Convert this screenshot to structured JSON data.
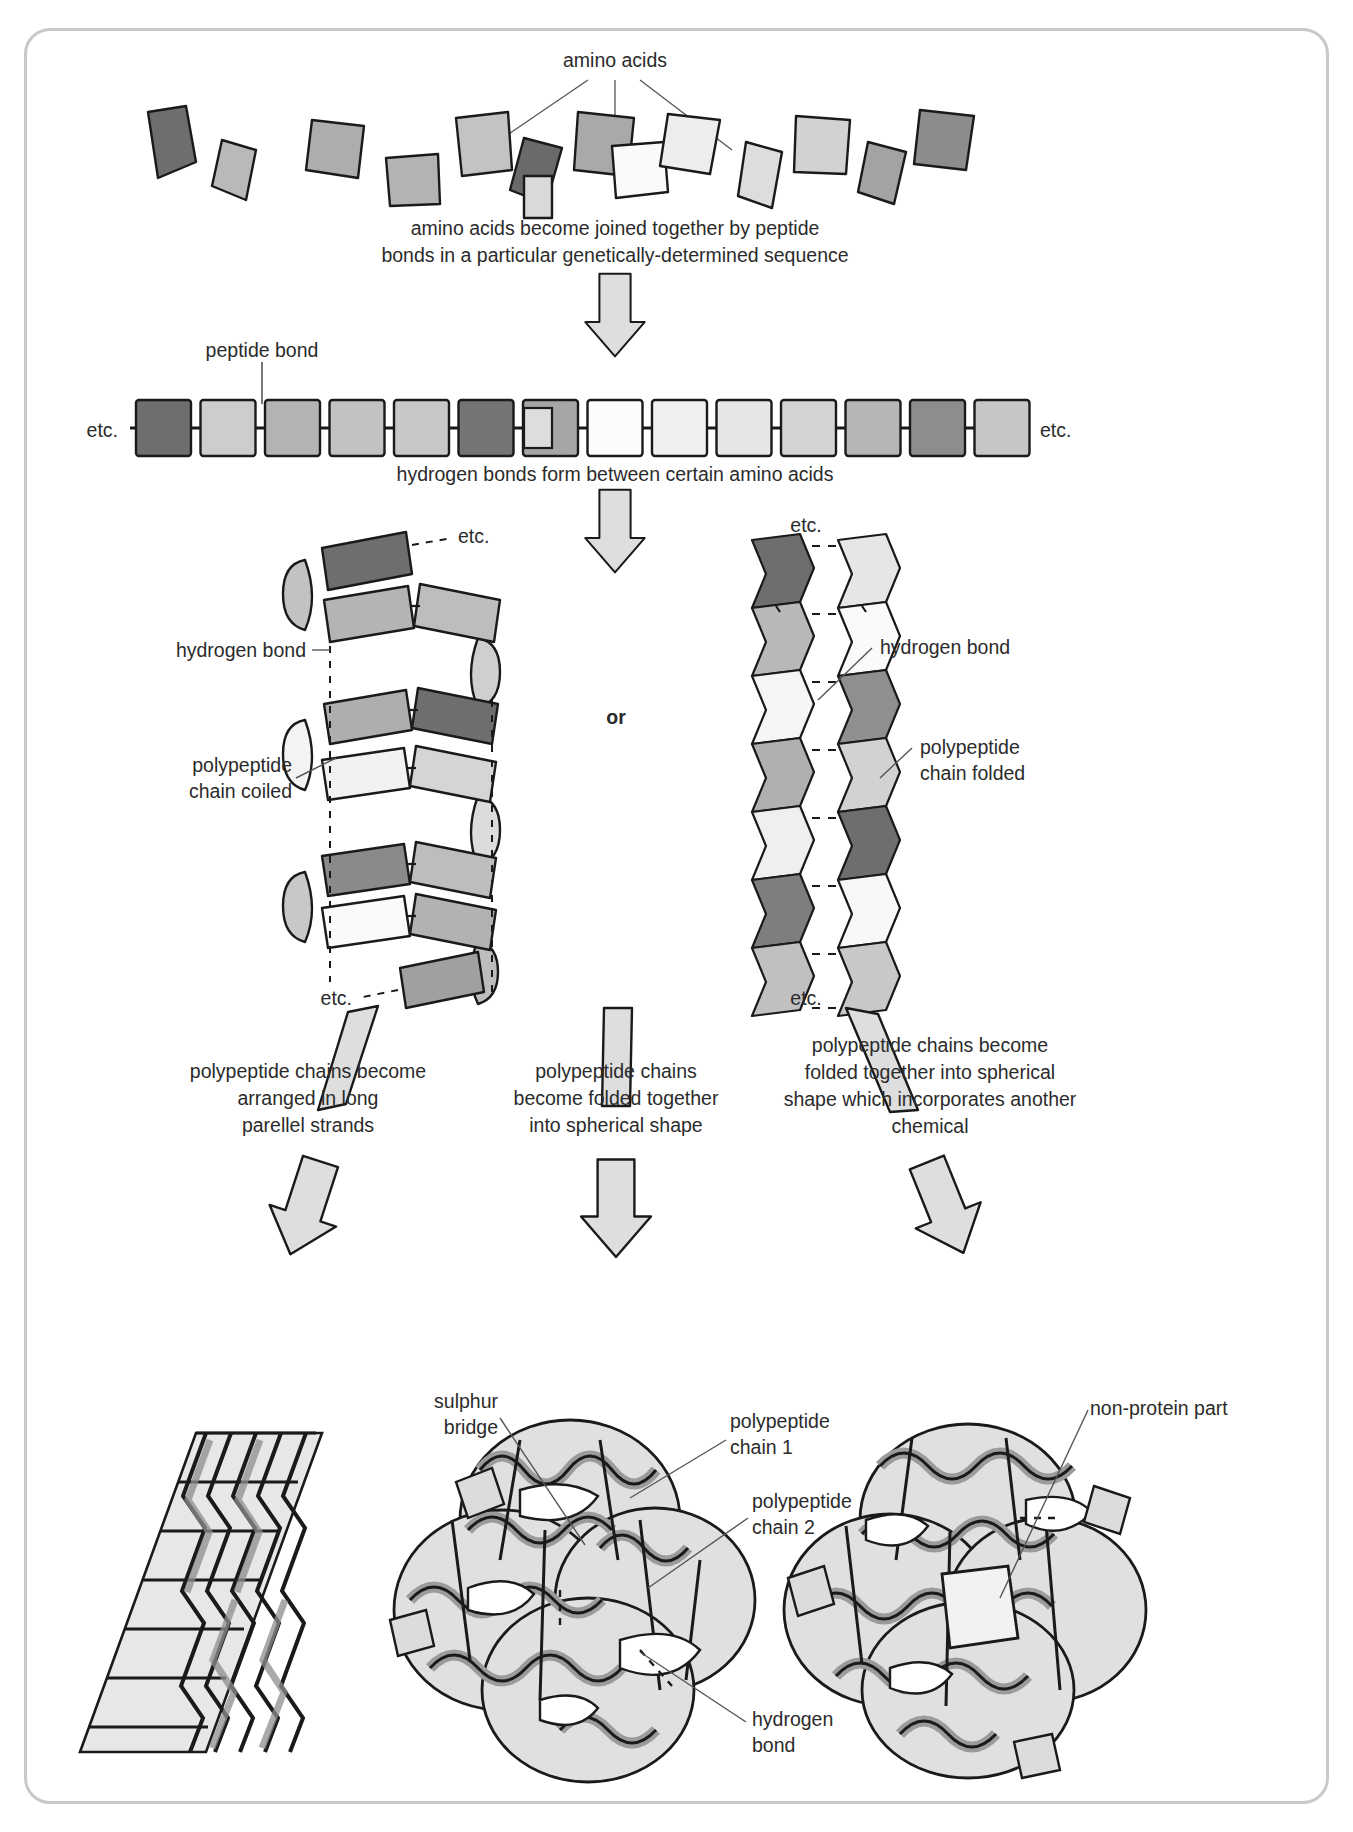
{
  "diagram": {
    "labels": {
      "amino_acids": "amino acids",
      "step1": "amino acids become joined together by peptide\nbonds in a particular genetically-determined sequence",
      "peptide_bond": "peptide bond",
      "etc_left_chain": "etc.",
      "etc_right_chain": "etc.",
      "step2": "hydrogen bonds form between certain amino acids",
      "or": "or",
      "helix_etc_top": "etc.",
      "helix_etc_bottom": "etc.",
      "helix_hydrogen_bond": "hydrogen bond",
      "helix_polypeptide": "polypeptide\nchain coiled",
      "sheet_etc_top": "etc.",
      "sheet_etc_bottom": "etc.",
      "sheet_hydrogen_bond": "hydrogen bond",
      "sheet_polypeptide": "polypeptide\nchain folded",
      "branch_left": "polypeptide chains become\narranged in long\nparellel strands",
      "branch_middle": "polypeptide chains\nbecome folded together\ninto spherical shape",
      "branch_right": "polypeptide chains become\nfolded together into spherical\nshape which incorporates another\nchemical",
      "sulphur_bridge": "sulphur\nbridge",
      "polypeptide_chain_1": "polypeptide\nchain 1",
      "polypeptide_chain_2": "polypeptide\nchain 2",
      "non_protein_part": "non-protein part",
      "globular_hydrogen_bond": "hydrogen\nbond"
    },
    "colors": {
      "outline": "#1a1a1a",
      "frame": "#c9c9c9",
      "text": "#2b2b2b",
      "arrow_fill": "#dedede",
      "ribbon_fill": "#9b9b9b",
      "blob_fill": "#e2e2e2",
      "leader_line": "#555555",
      "shades": [
        "#6e6e6e",
        "#b9b9b9",
        "#a8a8a8",
        "#bfbfbf",
        "#cdcdcd",
        "#727272",
        "#9e9e9e",
        "#fbfbfb",
        "#eeeeee",
        "#e4e4e4",
        "#d6d6d6",
        "#b0b0b0",
        "#8a8a8a",
        "#c4c4c4"
      ]
    },
    "scattered_amino_acids": [
      {
        "x": 152,
        "y": 128,
        "w": 58,
        "h": 48,
        "rot": -22,
        "shade": "#6e6e6e"
      },
      {
        "x": 207,
        "y": 160,
        "w": 52,
        "h": 45,
        "rot": 25,
        "shade": "#b9b9b9"
      },
      {
        "x": 286,
        "y": 143,
        "w": 58,
        "h": 48,
        "rot": -14,
        "shade": "#aeaeae"
      },
      {
        "x": 359,
        "y": 168,
        "w": 56,
        "h": 44,
        "rot": 6,
        "shade": "#b4b4b4"
      },
      {
        "x": 412,
        "y": 133,
        "w": 60,
        "h": 50,
        "rot": -12,
        "shade": "#c1c1c1"
      },
      {
        "x": 479,
        "y": 146,
        "w": 55,
        "h": 48,
        "rot": 20,
        "shade": "#6a6a6a"
      },
      {
        "x": 540,
        "y": 126,
        "w": 62,
        "h": 52,
        "rot": -8,
        "shade": "#a9a9a9"
      },
      {
        "x": 601,
        "y": 163,
        "w": 58,
        "h": 44,
        "rot": 8,
        "shade": "#fafafa"
      },
      {
        "x": 663,
        "y": 135,
        "w": 56,
        "h": 50,
        "rot": -16,
        "shade": "#ededed"
      },
      {
        "x": 727,
        "y": 155,
        "w": 54,
        "h": 48,
        "rot": 14,
        "shade": "#dedede"
      },
      {
        "x": 800,
        "y": 145,
        "w": 58,
        "h": 46,
        "rot": -6,
        "shade": "#d2d2d2"
      },
      {
        "x": 865,
        "y": 160,
        "w": 54,
        "h": 46,
        "rot": 18,
        "shade": "#a3a3a3"
      },
      {
        "x": 920,
        "y": 128,
        "w": 60,
        "h": 46,
        "rot": -18,
        "shade": "#8c8c8c"
      },
      {
        "x": 537,
        "y": 186,
        "w": 26,
        "h": 38,
        "rot": 0,
        "shade": "#d9d9d9"
      }
    ],
    "chain_blocks": {
      "left_label": "etc.",
      "right_label": "etc.",
      "shades": [
        "#6e6e6e",
        "#cdcdcd",
        "#b3b3b3",
        "#c2c2c2",
        "#c8c8c8",
        "#747474",
        "#a6a6a6",
        "#fcfcfc",
        "#f0f0f0",
        "#e6e6e6",
        "#d4d4d4",
        "#b6b6b6",
        "#8d8d8d",
        "#c6c6c6"
      ]
    },
    "helix_units": [
      {
        "shade": "#6e6e6e"
      },
      {
        "shade": "#b4b4b4"
      },
      {
        "shade": "#bdbdbd"
      },
      {
        "shade": "#aeaeae"
      },
      {
        "shade": "#6e6e6e"
      },
      {
        "shade": "#f2f2f2"
      },
      {
        "shade": "#d5d5d5"
      },
      {
        "shade": "#8a8a8a"
      },
      {
        "shade": "#bdbdbd"
      },
      {
        "shade": "#fafafa"
      },
      {
        "shade": "#b2b2b2"
      },
      {
        "shade": "#a0a0a0"
      }
    ],
    "sheet_units": {
      "left_column": [
        "#6e6e6e",
        "#b8b8b8",
        "#f5f5f5",
        "#b0b0b0",
        "#efefef",
        "#7e7e7e",
        "#c0c0c0",
        "#bdbdbd"
      ],
      "right_column": [
        "#e6e6e6",
        "#fafafa",
        "#8f8f8f",
        "#d2d2d2",
        "#6e6e6e",
        "#f8f8f8",
        "#c8c8c8",
        "#b8b8b8"
      ]
    }
  }
}
